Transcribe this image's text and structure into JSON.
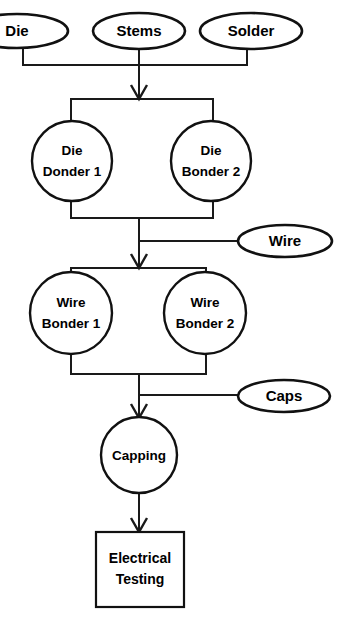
{
  "diagram": {
    "type": "process-flowchart",
    "colors": {
      "background": "#ffffff",
      "stroke": "#111111",
      "connector": "#1a1a1a",
      "text": "#000000"
    },
    "material_inputs": [
      {
        "id": "die",
        "label": "Die",
        "shape": "ellipse"
      },
      {
        "id": "stems",
        "label": "Stems",
        "shape": "ellipse"
      },
      {
        "id": "solder",
        "label": "Solder",
        "shape": "ellipse"
      },
      {
        "id": "wire",
        "label": "Wire",
        "shape": "ellipse"
      },
      {
        "id": "caps",
        "label": "Caps",
        "shape": "ellipse"
      }
    ],
    "process_stations": [
      {
        "id": "die-bonder-1",
        "line1": "Die",
        "line2": "Donder 1",
        "shape": "circle"
      },
      {
        "id": "die-bonder-2",
        "line1": "Die",
        "line2": "Bonder 2",
        "shape": "circle"
      },
      {
        "id": "wire-bonder-1",
        "line1": "Wire",
        "line2": "Bonder 1",
        "shape": "circle"
      },
      {
        "id": "wire-bonder-2",
        "line1": "Wire",
        "line2": "Bonder 2",
        "shape": "circle"
      },
      {
        "id": "capping",
        "line1": "Capping",
        "line2": "",
        "shape": "circle"
      }
    ],
    "terminal_steps": [
      {
        "id": "electrical-testing",
        "line1": "Electrical",
        "line2": "Testing",
        "shape": "rectangle"
      }
    ],
    "labels": {
      "die": "Die",
      "stems": "Stems",
      "solder": "Solder",
      "wire": "Wire",
      "caps": "Caps",
      "die_bonder_1_line1": "Die",
      "die_bonder_1_line2": "Donder 1",
      "die_bonder_2_line1": "Die",
      "die_bonder_2_line2": "Bonder 2",
      "wire_bonder_1_line1": "Wire",
      "wire_bonder_1_line2": "Bonder 1",
      "wire_bonder_2_line1": "Wire",
      "wire_bonder_2_line2": "Bonder 2",
      "capping": "Capping",
      "electrical_testing_line1": "Electrical",
      "electrical_testing_line2": "Testing"
    }
  }
}
